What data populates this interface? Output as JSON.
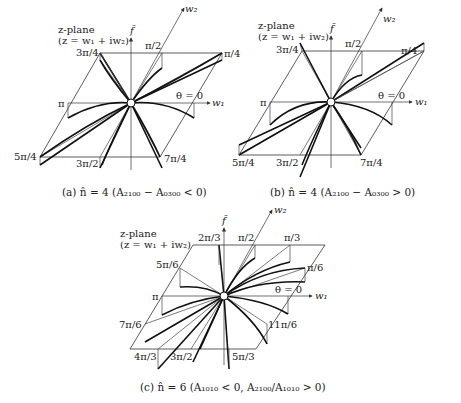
{
  "panels": [
    {
      "id": "a",
      "plane_label": [
        "z-plane",
        "(z = w₁ + iw₂)"
      ],
      "axis_labels": {
        "f": "f̃",
        "w1": "w₁",
        "w2": "w₂"
      },
      "angle_labels": [
        "θ = 0",
        "π/4",
        "π/2",
        "3π/4",
        "π",
        "5π/4",
        "3π/2",
        "7π/4"
      ],
      "caption": "(a)  n̂ = 4  (A₂₁₀₀ − A₀₃₀₀ < 0)",
      "n": 4
    },
    {
      "id": "b",
      "plane_label": [
        "z-plane",
        "(z = w₁ + iw₂)"
      ],
      "axis_labels": {
        "f": "f̃",
        "w1": "w₁",
        "w2": "w₂"
      },
      "angle_labels": [
        "θ = 0",
        "π/4",
        "π/2",
        "3π/4",
        "π",
        "5π/4",
        "3π/2",
        "7π/4"
      ],
      "caption": "(b)  n̂ = 4  (A₂₁₀₀ − A₀₃₀₀ > 0)",
      "n": 4
    },
    {
      "id": "c",
      "plane_label": [
        "z-plane",
        "(z = w₁ + iw₂)"
      ],
      "axis_labels": {
        "f": "f̃",
        "w1": "w₁",
        "w2": "w₂"
      },
      "angle_labels": [
        "θ = 0",
        "π/6",
        "π/3",
        "π/2",
        "2π/3",
        "5π/6",
        "π",
        "7π/6",
        "4π/3",
        "3π/2",
        "5π/3",
        "11π/6"
      ],
      "caption": "(c)  n̂ = 6  (A₁₀₁₀ < 0,  A₂₁₀₀/A₁₀₁₀ > 0)",
      "n": 6
    }
  ]
}
